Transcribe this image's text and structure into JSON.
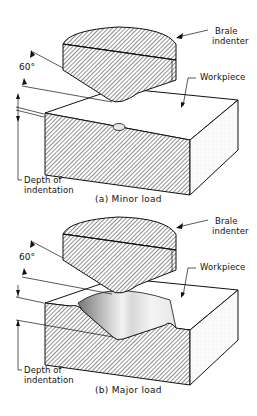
{
  "panels": [
    {
      "id": "a",
      "caption": "(a) Minor load",
      "labels": {
        "indenter_line1": "Brale",
        "indenter_line2": "indenter",
        "workpiece": "Workpiece",
        "angle": "60°",
        "depth_line1": "Depth of",
        "depth_line2": "indentation"
      }
    },
    {
      "id": "b",
      "caption": "(b) Major load",
      "labels": {
        "indenter_line1": "Brale",
        "indenter_line2": "indenter",
        "workpiece": "Workpiece",
        "angle": "60°",
        "depth_line1": "Depth of",
        "depth_line2": "indentation"
      }
    }
  ],
  "colors": {
    "line": "#111111",
    "hatch": "#222222",
    "background": "#ffffff"
  }
}
